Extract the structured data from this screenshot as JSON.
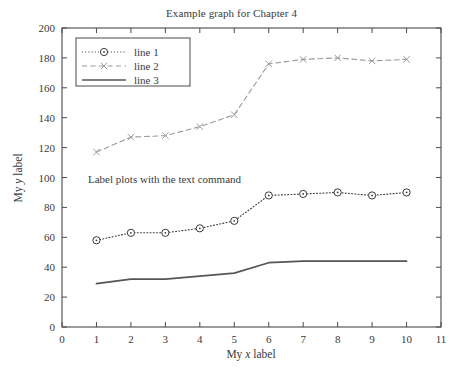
{
  "chart_data": {
    "type": "line",
    "title": "Example graph for Chapter 4",
    "xlabel": "My x label",
    "ylabel": "My y label",
    "xlim": [
      0,
      11
    ],
    "ylim": [
      0,
      200
    ],
    "xticks": [
      0,
      1,
      2,
      3,
      4,
      5,
      6,
      7,
      8,
      9,
      10,
      11
    ],
    "yticks": [
      0,
      20,
      40,
      60,
      80,
      100,
      120,
      140,
      160,
      180,
      200
    ],
    "grid": false,
    "legend_position": "upper left",
    "annotations": [
      {
        "text": "Label plots with the text command",
        "x": 1.2,
        "y": 100
      }
    ],
    "x": [
      1,
      2,
      3,
      4,
      5,
      6,
      7,
      8,
      9,
      10
    ],
    "series": [
      {
        "name": "line 1",
        "values": [
          58,
          63,
          63,
          66,
          71,
          88,
          89,
          90,
          88,
          90
        ],
        "color": "#3a3a3a",
        "linestyle": "dotted",
        "marker": "circle"
      },
      {
        "name": "line 2",
        "values": [
          117,
          127,
          128,
          134,
          142,
          176,
          179,
          180,
          178,
          179
        ],
        "color": "#9b9b9b",
        "linestyle": "dashed",
        "marker": "x"
      },
      {
        "name": "line 3",
        "values": [
          29,
          32,
          32,
          34,
          36,
          43,
          44,
          44,
          44,
          44
        ],
        "color": "#555555",
        "linestyle": "solid",
        "marker": "none"
      }
    ]
  },
  "legend": {
    "items": [
      {
        "label": "line 1"
      },
      {
        "label": "line 2"
      },
      {
        "label": "line 3"
      }
    ]
  }
}
